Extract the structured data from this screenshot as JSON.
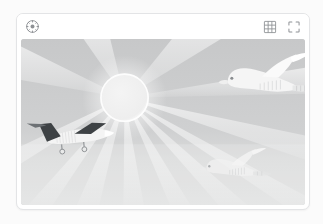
{
  "viewer": {
    "toolbar": {
      "left_tools": [
        {
          "name": "compass-icon",
          "label": "Orientation"
        }
      ],
      "right_tools": [
        {
          "name": "grid-icon",
          "label": "Grid overlay"
        },
        {
          "name": "fullscreen-icon",
          "label": "Fullscreen"
        }
      ]
    },
    "image": {
      "alt": "Grayscale photo of a sun with radiating light rays, a small private jet, and two birds in flight",
      "palette": {
        "sky_top": "#c9cacb",
        "sky_bottom": "#dcdddd",
        "ray": "#e2e3e3",
        "sun": "#f2f2f2",
        "sun_halo": "#fdfdfd",
        "subject_light": "#f3f3f3",
        "subject_dark": "#3c3f42"
      },
      "subjects": [
        {
          "name": "sun",
          "x": 105,
          "y": 58
        },
        {
          "name": "airplane",
          "x": 62,
          "y": 96
        },
        {
          "name": "bird-large",
          "x": 253,
          "y": 42
        },
        {
          "name": "bird-small",
          "x": 219,
          "y": 128
        }
      ]
    }
  }
}
